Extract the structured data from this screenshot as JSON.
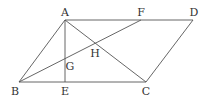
{
  "diagram": {
    "type": "geometry",
    "points": [
      {
        "name": "A",
        "x": 65,
        "y": 20,
        "lx": 65,
        "ly": 16
      },
      {
        "name": "F",
        "x": 141,
        "y": 20,
        "lx": 141,
        "ly": 16
      },
      {
        "name": "D",
        "x": 193,
        "y": 20,
        "lx": 194,
        "ly": 16
      },
      {
        "name": "B",
        "x": 19,
        "y": 82,
        "lx": 15,
        "ly": 95
      },
      {
        "name": "E",
        "x": 65,
        "y": 82,
        "lx": 65,
        "ly": 95
      },
      {
        "name": "C",
        "x": 146,
        "y": 82,
        "lx": 146,
        "ly": 95
      },
      {
        "name": "G",
        "x": 65,
        "y": 62,
        "lx": 70,
        "ly": 70
      },
      {
        "name": "H",
        "x": 96,
        "y": 44,
        "lx": 95,
        "ly": 57
      }
    ],
    "segments": [
      [
        "A",
        "D"
      ],
      [
        "B",
        "C"
      ],
      [
        "A",
        "B"
      ],
      [
        "D",
        "C"
      ],
      [
        "A",
        "E"
      ],
      [
        "A",
        "C"
      ],
      [
        "B",
        "F"
      ]
    ],
    "labels": {
      "A": "A",
      "B": "B",
      "C": "C",
      "D": "D",
      "E": "E",
      "F": "F",
      "G": "G",
      "H": "H"
    },
    "stroke_color": "#555555",
    "label_color": "#333333"
  }
}
